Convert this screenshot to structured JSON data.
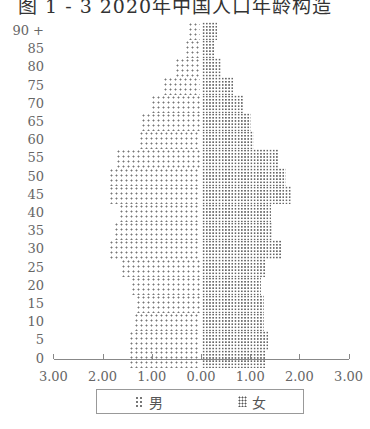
{
  "title": "图 1 - 3   2020年中国人口年龄构造",
  "chart_data": {
    "type": "bar",
    "orientation": "horizontal-population-pyramid",
    "title": "图 1 - 3   2020年中国人口年龄构造",
    "xlabel": "",
    "ylabel": "",
    "xlim": [
      -3.0,
      3.0
    ],
    "x_ticks": [
      "3.00",
      "2.00",
      "1.00",
      "0.00",
      "1.00",
      "2.00",
      "3.00"
    ],
    "categories": [
      "0",
      "5",
      "10",
      "15",
      "20",
      "25",
      "30",
      "35",
      "40",
      "45",
      "50",
      "55",
      "60",
      "65",
      "70",
      "75",
      "80",
      "85",
      "90+"
    ],
    "series": [
      {
        "name": "男",
        "side": "left",
        "color": "#777777",
        "values": [
          1.45,
          1.45,
          1.35,
          1.3,
          1.4,
          1.6,
          1.85,
          1.75,
          1.65,
          1.85,
          1.85,
          1.7,
          1.25,
          1.2,
          1.0,
          0.75,
          0.5,
          0.3,
          0.25
        ]
      },
      {
        "name": "女",
        "side": "right",
        "color": "#555555",
        "values": [
          1.3,
          1.35,
          1.25,
          1.25,
          1.2,
          1.3,
          1.6,
          1.45,
          1.4,
          1.8,
          1.7,
          1.55,
          1.05,
          1.0,
          0.85,
          0.65,
          0.4,
          0.25,
          0.3
        ]
      }
    ],
    "legend": {
      "position": "bottom",
      "entries": [
        "男",
        "女"
      ]
    },
    "grid": false
  },
  "axis": {
    "x_tick_labels": [
      "3.00",
      "2.00",
      "1.00",
      "0.00",
      "1.00",
      "2.00",
      "3.00"
    ],
    "y_tick_labels": [
      "90 +",
      "85",
      "80",
      "75",
      "70",
      "65",
      "60",
      "55",
      "50",
      "45",
      "40",
      "35",
      "30",
      "25",
      "20",
      "15",
      "10",
      "5",
      "0"
    ]
  },
  "legend": {
    "male": "男",
    "female": "女"
  }
}
